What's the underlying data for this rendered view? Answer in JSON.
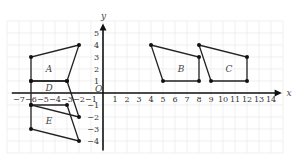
{
  "axes": {
    "x_label": "x",
    "y_label": "y",
    "origin_label": "O",
    "x_ticks": [
      -7,
      -6,
      -5,
      -4,
      -3,
      -2,
      -1,
      1,
      2,
      3,
      4,
      5,
      6,
      7,
      8,
      9,
      10,
      11,
      12,
      13,
      14
    ],
    "y_ticks": [
      5,
      4,
      3,
      2,
      1,
      -1,
      -2,
      -3,
      -4
    ],
    "x_range": [
      -8,
      15
    ],
    "y_range": [
      -5,
      6
    ]
  },
  "shapes": [
    {
      "name": "A",
      "points": [
        [
          -6,
          1
        ],
        [
          -6,
          3
        ],
        [
          -2,
          4
        ],
        [
          -3,
          1
        ]
      ],
      "label_at": [
        -4.5,
        2
      ]
    },
    {
      "name": "B",
      "points": [
        [
          5,
          1
        ],
        [
          4,
          4
        ],
        [
          8,
          3
        ],
        [
          8,
          1
        ]
      ],
      "label_at": [
        6.5,
        2
      ]
    },
    {
      "name": "C",
      "points": [
        [
          9,
          1
        ],
        [
          8,
          4
        ],
        [
          12,
          3
        ],
        [
          12,
          1
        ]
      ],
      "label_at": [
        10.5,
        2
      ]
    },
    {
      "name": "D",
      "points": [
        [
          -6,
          1
        ],
        [
          -3,
          1
        ],
        [
          -2,
          -2
        ],
        [
          -6,
          -1
        ]
      ],
      "label_at": [
        -4.5,
        0.4
      ]
    },
    {
      "name": "E",
      "points": [
        [
          -6,
          -1
        ],
        [
          -3,
          -1
        ],
        [
          -2,
          -4
        ],
        [
          -6,
          -3
        ]
      ],
      "label_at": [
        -4.5,
        -2.3
      ]
    }
  ]
}
